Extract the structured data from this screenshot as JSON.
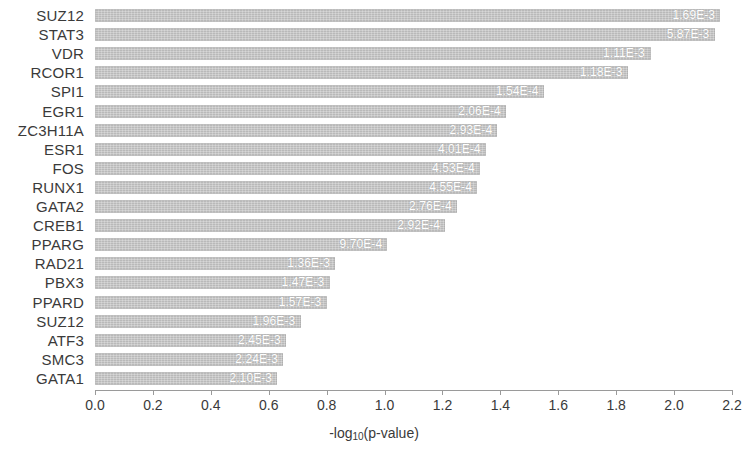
{
  "chart_data": {
    "type": "bar",
    "orientation": "horizontal",
    "title": "",
    "xlabel": "-log10(p-value)",
    "ylabel": "",
    "xlim": [
      0.0,
      2.2
    ],
    "xticks": [
      "0.0",
      "0.2",
      "0.4",
      "0.6",
      "0.8",
      "1.0",
      "1.2",
      "1.4",
      "1.6",
      "1.8",
      "2.0",
      "2.2"
    ],
    "xtick_values": [
      0.0,
      0.2,
      0.4,
      0.6,
      0.8,
      1.0,
      1.2,
      1.4,
      1.6,
      1.8,
      2.0,
      2.2
    ],
    "grid": false,
    "legend": null,
    "bar_color": "#b9b9b9",
    "categories": [
      "SUZ12",
      "STAT3",
      "VDR",
      "RCOR1",
      "SPI1",
      "EGR1",
      "ZC3H11A",
      "ESR1",
      "FOS",
      "RUNX1",
      "GATA2",
      "CREB1",
      "PPARG",
      "RAD21",
      "PBX3",
      "PPARD",
      "SUZ12",
      "ATF3",
      "SMC3",
      "GATA1"
    ],
    "values": [
      2.16,
      2.14,
      1.92,
      1.84,
      1.55,
      1.42,
      1.39,
      1.35,
      1.33,
      1.32,
      1.25,
      1.21,
      1.01,
      0.83,
      0.81,
      0.8,
      0.71,
      0.66,
      0.65,
      0.63
    ],
    "bar_labels": [
      "1.69E-3",
      "5.87E-3",
      "1.11E-3",
      "1.18E-3",
      "1.54E-4",
      "2.06E-4",
      "2.93E-4",
      "4.01E-4",
      "4.53E-4",
      "4.55E-4",
      "2.76E-4",
      "2.92E-4",
      "9.70E-4",
      "1.36E-3",
      "1.47E-3",
      "1.57E-3",
      "1.96E-3",
      "2.45E-3",
      "2.24E-3",
      "2.10E-3"
    ]
  },
  "axis": {
    "x_title_main": "-log",
    "x_title_sub": "10",
    "x_title_tail": "(p-value)"
  }
}
